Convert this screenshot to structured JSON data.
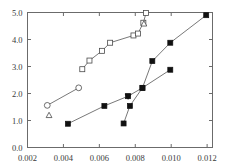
{
  "chart_data": {
    "type": "line",
    "title": "",
    "subtitle": "",
    "xlabel": "",
    "ylabel": "",
    "xlim": [
      0.002,
      0.0123
    ],
    "ylim": [
      0.0,
      5.0
    ],
    "grid": false,
    "legend": "none",
    "xticks": [
      0.002,
      0.004,
      0.006,
      0.008,
      0.01,
      0.012
    ],
    "xtick_labels": [
      "0.002",
      "0.004",
      "0.006",
      "0.008",
      "0.010",
      "0.012"
    ],
    "yticks": [
      0.0,
      1.0,
      2.0,
      3.0,
      4.0,
      5.0
    ],
    "ytick_labels": [
      "0.0",
      "1.0",
      "2.0",
      "3.0",
      "4.0",
      "5.0"
    ],
    "series": [
      {
        "name": "open-circle-lower-left",
        "marker": "circle-open",
        "connected": true,
        "points": [
          {
            "x": 0.0031,
            "y": 1.56
          },
          {
            "x": 0.00485,
            "y": 2.21
          }
        ]
      },
      {
        "name": "open-triangle-lower-left",
        "marker": "triangle-open",
        "connected": false,
        "points": [
          {
            "x": 0.0032,
            "y": 1.19
          }
        ]
      },
      {
        "name": "open-square-upper",
        "marker": "square-open",
        "connected": true,
        "points": [
          {
            "x": 0.00505,
            "y": 2.9
          },
          {
            "x": 0.00545,
            "y": 3.22
          },
          {
            "x": 0.00615,
            "y": 3.58
          },
          {
            "x": 0.0066,
            "y": 3.88
          },
          {
            "x": 0.0079,
            "y": 4.15
          },
          {
            "x": 0.00815,
            "y": 4.22
          },
          {
            "x": 0.00845,
            "y": 4.62
          },
          {
            "x": 0.0086,
            "y": 4.98
          }
        ]
      },
      {
        "name": "open-triangle-upper",
        "marker": "triangle-open",
        "connected": false,
        "points": [
          {
            "x": 0.00848,
            "y": 4.58
          }
        ]
      },
      {
        "name": "filled-square-lower",
        "marker": "square-filled",
        "connected": true,
        "points": [
          {
            "x": 0.00425,
            "y": 0.88
          },
          {
            "x": 0.00628,
            "y": 1.54
          },
          {
            "x": 0.0076,
            "y": 1.9
          },
          {
            "x": 0.0084,
            "y": 2.21
          },
          {
            "x": 0.00895,
            "y": 3.2
          },
          {
            "x": 0.00995,
            "y": 3.88
          },
          {
            "x": 0.01195,
            "y": 4.9
          }
        ]
      },
      {
        "name": "filled-square-steep",
        "marker": "square-filled",
        "connected": true,
        "points": [
          {
            "x": 0.00735,
            "y": 0.89
          },
          {
            "x": 0.0077,
            "y": 1.54
          },
          {
            "x": 0.0084,
            "y": 2.21
          },
          {
            "x": 0.00995,
            "y": 2.88
          }
        ]
      },
      {
        "name": "filled-triangle-down",
        "marker": "triangle-down-filled",
        "connected": false,
        "points": [
          {
            "x": 0.0076,
            "y": 1.9
          }
        ]
      }
    ],
    "colors": {
      "axis": "#6b6b6b",
      "line": "#555555",
      "marker_filled": "#111111",
      "marker_open_stroke": "#4a4a4a",
      "background": "#ffffff",
      "tick_label": "#3a3a3a"
    }
  }
}
